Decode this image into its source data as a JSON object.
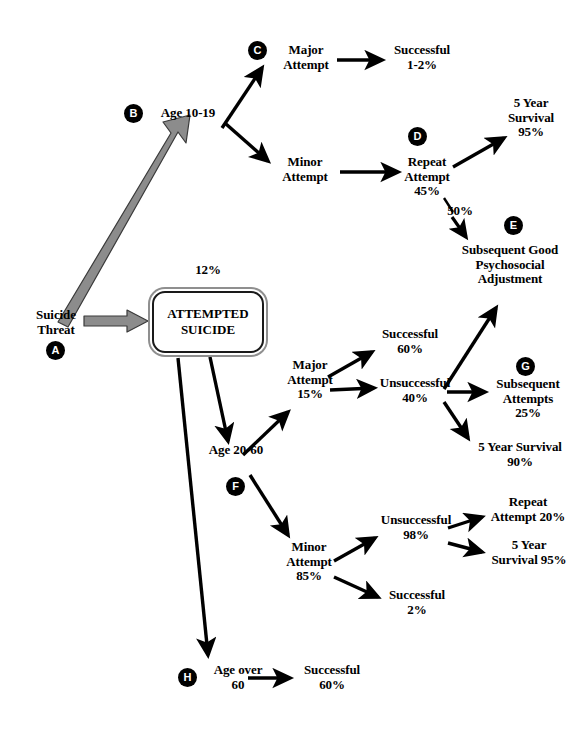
{
  "diagram": {
    "type": "flowchart",
    "background_color": "#ffffff",
    "text_color": "#000000",
    "fat_arrow_color": "#8c8c8c",
    "badge_color": "#000000",
    "badge_text_color": "#ffffff"
  },
  "nodes": {
    "a": {
      "badge": "A",
      "label": "Suicide\nThreat"
    },
    "box": {
      "label": "ATTEMPTED\nSUICIDE",
      "rate": "12%"
    },
    "b": {
      "badge": "B",
      "label": "Age 10-19"
    },
    "c": {
      "badge": "C",
      "label": "Major\nAttempt"
    },
    "b_minor": {
      "label": "Minor\nAttempt"
    },
    "c_successful": {
      "label": "Successful\n1-2%"
    },
    "d": {
      "badge": "D",
      "label": "Repeat\nAttempt\n45%"
    },
    "d_survival": {
      "label": "5 Year\nSurvival\n95%"
    },
    "d_to_e_rate": {
      "label": "50%"
    },
    "e": {
      "badge": "E",
      "label": "Subsequent Good\nPsychosocial\nAdjustment"
    },
    "f": {
      "badge": "F",
      "label": "Age 20-60"
    },
    "f_major": {
      "label": "Major\nAttempt\n15%"
    },
    "f_major_successful": {
      "label": "Successful\n60%"
    },
    "f_major_unsuccessful": {
      "label": "Unsuccessful\n40%"
    },
    "g": {
      "badge": "G",
      "label": "Subsequent\nAttempts\n25%"
    },
    "g_survival": {
      "label": "5 Year Survival\n90%"
    },
    "f_minor": {
      "label": "Minor\nAttempt\n85%"
    },
    "f_minor_unsuccessful": {
      "label": "Unsuccessful\n98%"
    },
    "f_minor_repeat": {
      "label": "Repeat\nAttempt 20%"
    },
    "f_minor_survival": {
      "label": "5 Year\nSurvival 95%"
    },
    "f_minor_successful": {
      "label": "Successful\n2%"
    },
    "h": {
      "badge": "H",
      "label": "Age over\n60"
    },
    "h_successful": {
      "label": "Successful\n60%"
    }
  },
  "edges": [
    {
      "from": "a",
      "to": "box",
      "style": "thick-gray-block"
    },
    {
      "from": "a",
      "to": "b",
      "style": "thick-gray-block"
    },
    {
      "from": "b",
      "to": "c",
      "style": "thin-black"
    },
    {
      "from": "b",
      "to": "b_minor",
      "style": "thin-black"
    },
    {
      "from": "c",
      "to": "c_successful",
      "style": "thin-black"
    },
    {
      "from": "b_minor",
      "to": "d",
      "style": "thin-black"
    },
    {
      "from": "d",
      "to": "d_survival",
      "style": "thin-black"
    },
    {
      "from": "d",
      "to": "e",
      "style": "thin-black",
      "label": "50%"
    },
    {
      "from": "box",
      "to": "f",
      "style": "thin-black"
    },
    {
      "from": "box",
      "to": "h",
      "style": "thin-black"
    },
    {
      "from": "f",
      "to": "f_major",
      "style": "thin-black"
    },
    {
      "from": "f",
      "to": "f_minor",
      "style": "thin-black"
    },
    {
      "from": "f_major",
      "to": "f_major_successful",
      "style": "thin-black"
    },
    {
      "from": "f_major",
      "to": "f_major_unsuccessful",
      "style": "thin-black"
    },
    {
      "from": "f_major_unsuccessful",
      "to": "e",
      "style": "thin-black"
    },
    {
      "from": "f_major_unsuccessful",
      "to": "g",
      "style": "thin-black"
    },
    {
      "from": "f_major_unsuccessful",
      "to": "g_survival",
      "style": "thin-black"
    },
    {
      "from": "f_minor",
      "to": "f_minor_unsuccessful",
      "style": "thin-black"
    },
    {
      "from": "f_minor",
      "to": "f_minor_successful",
      "style": "thin-black"
    },
    {
      "from": "f_minor_unsuccessful",
      "to": "f_minor_repeat",
      "style": "thin-black"
    },
    {
      "from": "f_minor_unsuccessful",
      "to": "f_minor_survival",
      "style": "thin-black"
    },
    {
      "from": "h",
      "to": "h_successful",
      "style": "thin-black"
    }
  ]
}
